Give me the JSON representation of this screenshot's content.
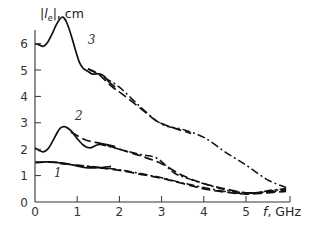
{
  "chart_data": {
    "type": "line",
    "title": "",
    "xlabel": "f, GHz",
    "ylabel": "|l_e|, cm",
    "xlim": [
      0,
      6.0
    ],
    "ylim": [
      0,
      7
    ],
    "grid": false,
    "legend": "curve numbers 1, 2, 3 labelled inline",
    "x_ticks": [
      0,
      1,
      2,
      3,
      4,
      5
    ],
    "x_tick_labels": [
      "0",
      "1",
      "2",
      "3",
      "4",
      "5"
    ],
    "y_ticks": [
      0,
      1,
      2,
      3,
      4,
      5,
      6
    ],
    "y_tick_labels": [
      "0",
      "1",
      "2",
      "3",
      "4",
      "5",
      "6"
    ],
    "curve_labels": [
      {
        "text": "1",
        "x": 0.45,
        "y": 0.95
      },
      {
        "text": "2",
        "x": 0.95,
        "y": 3.1
      },
      {
        "text": "3",
        "x": 1.25,
        "y": 6.0
      }
    ],
    "series": [
      {
        "name": "3 (solid, measured)",
        "style": "solid",
        "x": [
          0.0,
          0.1,
          0.2,
          0.3,
          0.4,
          0.5,
          0.6,
          0.67,
          0.75,
          0.85,
          0.95,
          1.05,
          1.15,
          1.25,
          1.35,
          1.45,
          1.55,
          1.65,
          1.75,
          1.9
        ],
        "y": [
          6.0,
          5.95,
          5.9,
          6.05,
          6.35,
          6.7,
          6.95,
          7.0,
          6.8,
          6.35,
          5.8,
          5.3,
          5.05,
          4.95,
          4.85,
          4.85,
          4.85,
          4.75,
          4.55,
          4.35
        ]
      },
      {
        "name": "3 (dashed)",
        "style": "dash",
        "x": [
          1.25,
          1.5,
          1.8,
          2.1,
          2.5,
          2.9,
          3.3,
          3.7
        ],
        "y": [
          5.05,
          4.85,
          4.4,
          4.05,
          3.55,
          3.05,
          2.8,
          2.6
        ]
      },
      {
        "name": "3 (dash-dot)",
        "style": "dashdot",
        "x": [
          1.3,
          1.6,
          2.0,
          2.5,
          3.0,
          3.5,
          4.0,
          4.5,
          5.0,
          5.5,
          5.95
        ],
        "y": [
          5.0,
          4.75,
          4.35,
          3.6,
          2.95,
          2.75,
          2.45,
          1.9,
          1.4,
          0.85,
          0.55
        ]
      },
      {
        "name": "2 (solid, measured)",
        "style": "solid",
        "x": [
          0.0,
          0.1,
          0.2,
          0.3,
          0.4,
          0.5,
          0.6,
          0.72,
          0.85,
          1.0,
          1.15,
          1.3,
          1.45,
          1.6,
          1.75,
          1.9
        ],
        "y": [
          2.05,
          1.95,
          1.9,
          2.0,
          2.25,
          2.55,
          2.8,
          2.85,
          2.7,
          2.4,
          2.15,
          2.05,
          2.15,
          2.2,
          2.15,
          2.1
        ]
      },
      {
        "name": "2 (dashed)",
        "style": "dash",
        "x": [
          0.85,
          1.2,
          1.6,
          2.0,
          2.5,
          3.0,
          3.5,
          4.0,
          4.5,
          5.0,
          5.5,
          5.95
        ],
        "y": [
          2.65,
          2.35,
          2.2,
          2.0,
          1.75,
          1.45,
          1.0,
          0.7,
          0.5,
          0.35,
          0.38,
          0.45
        ]
      },
      {
        "name": "2 (dash-dot)",
        "style": "dashdot",
        "x": [
          1.5,
          2.0,
          2.5,
          2.9,
          3.3,
          3.7,
          4.2,
          4.7,
          5.2,
          5.6,
          5.95
        ],
        "y": [
          2.2,
          2.0,
          1.8,
          1.65,
          1.1,
          0.85,
          0.6,
          0.4,
          0.35,
          0.45,
          0.5
        ]
      },
      {
        "name": "1 (solid, measured)",
        "style": "solid",
        "x": [
          0.0,
          0.3,
          0.6,
          0.9,
          1.2,
          1.5,
          1.8
        ],
        "y": [
          1.5,
          1.52,
          1.48,
          1.4,
          1.3,
          1.3,
          1.35
        ]
      },
      {
        "name": "1 (dashed)",
        "style": "dash",
        "x": [
          0.0,
          0.5,
          1.0,
          1.5,
          2.0,
          2.5,
          3.0,
          3.5,
          4.0,
          4.5,
          5.0,
          5.5,
          5.95
        ],
        "y": [
          1.5,
          1.5,
          1.38,
          1.3,
          1.2,
          1.05,
          0.9,
          0.7,
          0.5,
          0.38,
          0.3,
          0.35,
          0.4
        ]
      },
      {
        "name": "1 (dash-dot)",
        "style": "dashdot",
        "x": [
          0.6,
          1.0,
          1.5,
          2.0,
          2.5,
          3.0,
          3.5,
          4.0,
          4.5,
          5.0,
          5.5,
          5.95
        ],
        "y": [
          1.45,
          1.4,
          1.32,
          1.22,
          1.08,
          0.92,
          0.72,
          0.55,
          0.4,
          0.32,
          0.4,
          0.5
        ]
      }
    ]
  }
}
